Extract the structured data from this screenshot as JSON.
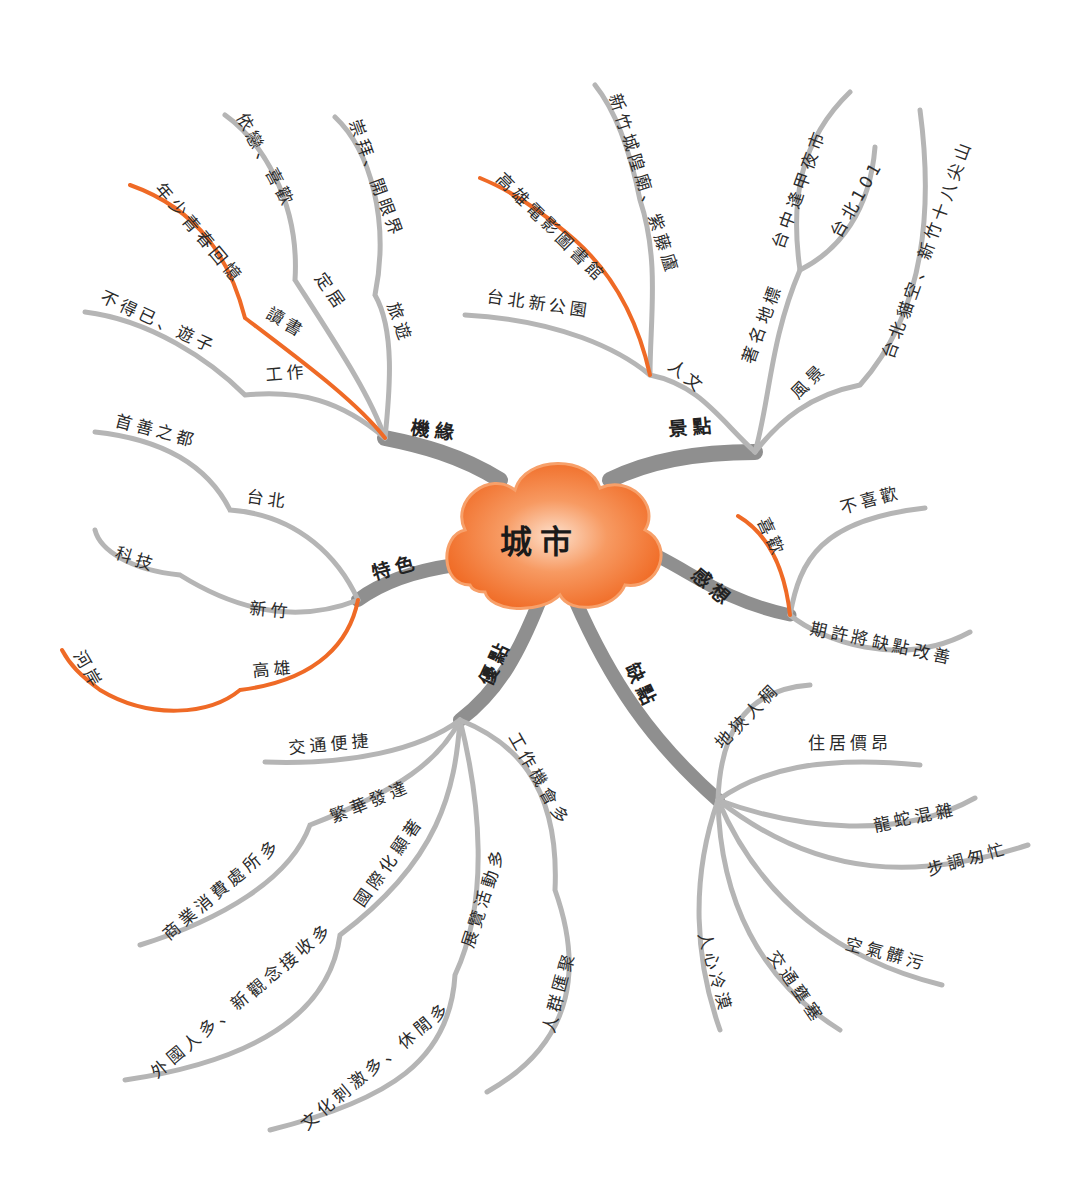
{
  "colors": {
    "center_fill": "#f47a36",
    "center_highlight": "#fcd2b4",
    "main_branch": "#8f8f8f",
    "sub_branch": "#b5b5b5",
    "highlight_branch": "#ef6a26"
  },
  "center": {
    "label": "城市"
  },
  "branches": [
    {
      "label": "機緣",
      "children": [
        {
          "label": "工作",
          "children": [
            {
              "label": "不得已、遊子"
            }
          ]
        },
        {
          "label": "讀書",
          "highlight": true,
          "children": [
            {
              "label": "年少青春回憶",
              "highlight": true
            }
          ]
        },
        {
          "label": "定居",
          "children": [
            {
              "label": "依戀、喜歡"
            }
          ]
        },
        {
          "label": "旅遊",
          "children": [
            {
              "label": "崇拜、開眼界"
            }
          ]
        }
      ]
    },
    {
      "label": "景點",
      "children": [
        {
          "label": "人文",
          "children": [
            {
              "label": "台北新公園"
            },
            {
              "label": "高雄電影圖書館",
              "highlight": true
            },
            {
              "label": "新竹城隍廟、紫藤廬"
            }
          ]
        },
        {
          "label": "著名地標",
          "children": [
            {
              "label": "台中逢甲夜市"
            },
            {
              "label": "台北101"
            }
          ]
        },
        {
          "label": "風景",
          "children": [
            {
              "label": "台北貓空、新竹十八尖山"
            }
          ]
        }
      ]
    },
    {
      "label": "特色",
      "children": [
        {
          "label": "台北",
          "children": [
            {
              "label": "首善之都"
            }
          ]
        },
        {
          "label": "新竹",
          "children": [
            {
              "label": "科技"
            }
          ]
        },
        {
          "label": "高雄",
          "highlight": true,
          "children": [
            {
              "label": "河岸",
              "highlight": true
            }
          ]
        }
      ]
    },
    {
      "label": "感想",
      "children": [
        {
          "label": "喜歡",
          "highlight": true
        },
        {
          "label": "不喜歡"
        },
        {
          "label": "期許將缺點改善"
        }
      ]
    },
    {
      "label": "優點",
      "children": [
        {
          "label": "交通便捷"
        },
        {
          "label": "繁華發達",
          "children": [
            {
              "label": "商業消費處所多"
            }
          ]
        },
        {
          "label": "國際化顯著",
          "children": [
            {
              "label": "外國人多、新觀念接收多"
            }
          ]
        },
        {
          "label": "展覽活動多",
          "children": [
            {
              "label": "文化刺激多、休閒多"
            }
          ]
        },
        {
          "label": "工作機會多",
          "children": [
            {
              "label": "人群匯聚"
            }
          ]
        }
      ]
    },
    {
      "label": "缺點",
      "children": [
        {
          "label": "地狹人稠"
        },
        {
          "label": "住居價昂"
        },
        {
          "label": "龍蛇混雜"
        },
        {
          "label": "步調匆忙"
        },
        {
          "label": "空氣髒污"
        },
        {
          "label": "交通壅塞"
        },
        {
          "label": "人心冷漠"
        }
      ]
    }
  ]
}
